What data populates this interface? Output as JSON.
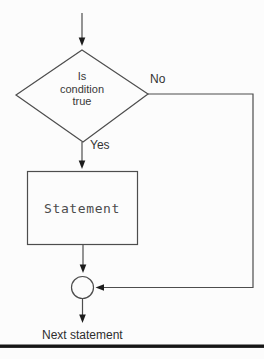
{
  "flowchart": {
    "title": "if-condition flowchart",
    "decision": {
      "shape": "diamond",
      "line1": "Is",
      "line2": "condition",
      "line3": "true"
    },
    "branches": {
      "no_label": "No",
      "yes_label": "Yes"
    },
    "process": {
      "shape": "rectangle",
      "label": "Statement"
    },
    "connector": {
      "shape": "circle"
    },
    "exit": {
      "label": "Next statement"
    }
  },
  "colors": {
    "background": "#fcfcfc",
    "line": "#4d4d4d",
    "arrowhead": "#1c1c1c",
    "shape_fill": "#fcfcfc",
    "text": "#333333",
    "bottom_rule": "#161616"
  }
}
